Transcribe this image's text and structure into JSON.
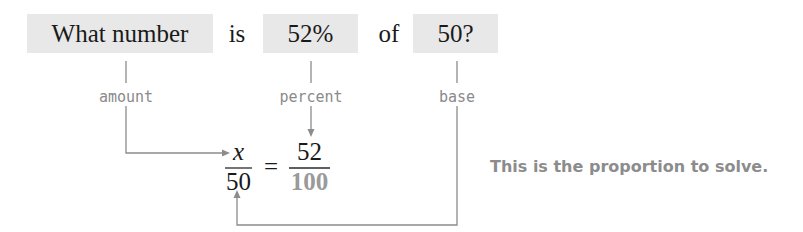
{
  "sentence": {
    "amount_phrase": "What number",
    "is_word": "is",
    "percent_value": "52%",
    "of_word": "of",
    "base_value": "50?"
  },
  "labels": {
    "amount": "amount",
    "percent": "percent",
    "base": "base"
  },
  "proportion": {
    "left_numerator": "x",
    "left_denominator": "50",
    "equals": "=",
    "right_numerator": "52",
    "right_denominator": "100"
  },
  "note": "This is the proportion to solve.",
  "colors": {
    "box_fill": "#e8e8e8",
    "label_gray": "#8a8a8a",
    "line_gray": "#8c8c8c",
    "text_dark": "#1a1a1a"
  }
}
